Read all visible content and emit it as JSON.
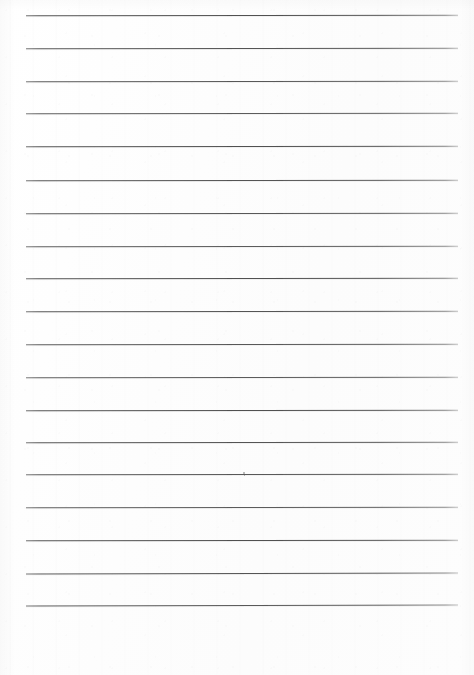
{
  "document": {
    "kind": "scanned-blank-ruled-paper",
    "title": "Blank Lined Paper (scan)",
    "page_width": 474,
    "page_height": 675,
    "background_color": "#fdfdfd",
    "text_content": "",
    "handwriting_present": "none"
  },
  "ruling": {
    "line_color": "#4a4a4a",
    "line_thickness_px": 1,
    "line_count": 19,
    "left_x": 26,
    "right_x": 458,
    "first_line_y": 15,
    "line_spacing_px": 32.8,
    "lines_y": [
      15,
      48,
      81,
      113,
      146,
      180,
      213,
      246,
      278,
      311,
      344,
      377,
      410,
      442,
      474,
      507,
      540,
      573,
      605
    ]
  },
  "margins": {
    "top_margin_px": 15,
    "left_margin_px": 26,
    "right_margin_px": 16,
    "bottom_blank_area_px": 70
  },
  "artifacts": {
    "specks": [
      {
        "name": "ink-speck",
        "x": 243,
        "y": 472,
        "size": 2
      },
      {
        "name": "dust-speck",
        "x": 244,
        "y": 475,
        "size": 1
      }
    ]
  }
}
